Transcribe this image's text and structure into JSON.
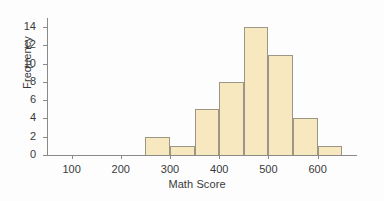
{
  "chart_data": {
    "type": "bar",
    "title": "",
    "subtitle": "",
    "xlabel": "Math Score",
    "ylabel": "Frequency",
    "xlim": [
      50,
      680
    ],
    "ylim": [
      0,
      15
    ],
    "grid": false,
    "legend": null,
    "bin_width": 50,
    "bin_edges": [
      250,
      300,
      350,
      400,
      450,
      500,
      550,
      600,
      650
    ],
    "categories": [
      "250-300",
      "300-350",
      "350-400",
      "400-450",
      "450-500",
      "500-550",
      "550-600",
      "600-650"
    ],
    "values": [
      2,
      1,
      5,
      8,
      14,
      11,
      4,
      1
    ],
    "xticks": [
      100,
      200,
      300,
      400,
      500,
      600
    ],
    "xtick_labels": [
      "100",
      "200",
      "300",
      "400",
      "500",
      "600"
    ],
    "yticks": [
      0,
      2,
      4,
      6,
      8,
      10,
      12,
      14
    ],
    "ytick_labels": [
      "0",
      "2",
      "4",
      "6",
      "8",
      "10",
      "12",
      "14"
    ],
    "bar_fill_color": "#f7e8c0",
    "bar_edge_color": "#9c9684",
    "axis_color": "#8a8a8a",
    "background_color": "#fdfdfe",
    "text_color": "#3a3a3a"
  }
}
